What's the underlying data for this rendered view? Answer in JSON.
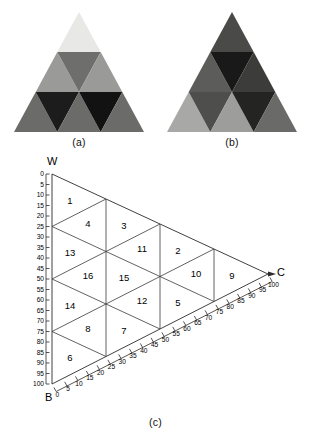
{
  "figure": {
    "panels": [
      {
        "id": "a",
        "caption": "(a)",
        "description": "subdivided-triangle-light-to-dark",
        "rows": 3,
        "cells": [
          {
            "index": 0,
            "row": 0,
            "pos": 0,
            "orientation": "up",
            "color": "#e8e8e6"
          },
          {
            "index": 1,
            "row": 1,
            "pos": 0,
            "orientation": "up",
            "color": "#9a9a98"
          },
          {
            "index": 2,
            "row": 1,
            "pos": 1,
            "orientation": "down",
            "color": "#6e6e6c"
          },
          {
            "index": 3,
            "row": 1,
            "pos": 2,
            "orientation": "up",
            "color": "#9a9a98"
          },
          {
            "index": 4,
            "row": 2,
            "pos": 0,
            "orientation": "up",
            "color": "#6b6b69"
          },
          {
            "index": 5,
            "row": 2,
            "pos": 1,
            "orientation": "down",
            "color": "#1c1c1c"
          },
          {
            "index": 6,
            "row": 2,
            "pos": 2,
            "orientation": "up",
            "color": "#6b6b69"
          },
          {
            "index": 7,
            "row": 2,
            "pos": 3,
            "orientation": "down",
            "color": "#121212"
          },
          {
            "index": 8,
            "row": 2,
            "pos": 4,
            "orientation": "up",
            "color": "#6b6b69"
          }
        ]
      },
      {
        "id": "b",
        "caption": "(b)",
        "description": "subdivided-triangle-dark-to-light",
        "rows": 3,
        "cells": [
          {
            "index": 0,
            "row": 0,
            "pos": 0,
            "orientation": "up",
            "color": "#4a4a48"
          },
          {
            "index": 1,
            "row": 1,
            "pos": 0,
            "orientation": "up",
            "color": "#5c5c5a"
          },
          {
            "index": 2,
            "row": 1,
            "pos": 1,
            "orientation": "down",
            "color": "#191919"
          },
          {
            "index": 3,
            "row": 1,
            "pos": 2,
            "orientation": "up",
            "color": "#3c3c3a"
          },
          {
            "index": 4,
            "row": 2,
            "pos": 0,
            "orientation": "up",
            "color": "#a8a8a6"
          },
          {
            "index": 5,
            "row": 2,
            "pos": 1,
            "orientation": "down",
            "color": "#4e4e4c"
          },
          {
            "index": 6,
            "row": 2,
            "pos": 2,
            "orientation": "up",
            "color": "#9d9d9b"
          },
          {
            "index": 7,
            "row": 2,
            "pos": 3,
            "orientation": "down",
            "color": "#242422"
          },
          {
            "index": 8,
            "row": 2,
            "pos": 4,
            "orientation": "up",
            "color": "#6a6a68"
          }
        ]
      },
      {
        "id": "c",
        "caption": "(c)",
        "description": "ternary-diagram-numbered-cells"
      }
    ]
  },
  "chart_data": {
    "type": "ternary",
    "title": "",
    "vertices": [
      {
        "label": "W",
        "position": "top-left",
        "value": 0
      },
      {
        "label": "B",
        "position": "bottom-left",
        "value": 100
      },
      {
        "label": "C",
        "position": "right",
        "value": 100
      }
    ],
    "axes": [
      {
        "name": "left-axis",
        "from_label": "W",
        "to_label": "B",
        "min": 0,
        "max": 100,
        "step": 5,
        "ticks": [
          0,
          5,
          10,
          15,
          20,
          25,
          30,
          35,
          40,
          45,
          50,
          55,
          60,
          65,
          70,
          75,
          80,
          85,
          90,
          95,
          100
        ]
      },
      {
        "name": "bottom-axis",
        "from_label": "B",
        "to_label": "C",
        "min": 0,
        "max": 100,
        "step": 5,
        "ticks": [
          0,
          5,
          10,
          15,
          20,
          25,
          30,
          35,
          40,
          45,
          50,
          55,
          60,
          65,
          70,
          75,
          80,
          85,
          90,
          95,
          100
        ]
      }
    ],
    "grid": true,
    "grid_step": 25,
    "cell_count": 16,
    "cells": [
      {
        "label": "1",
        "orientation": "up",
        "row": 0,
        "pos": 0
      },
      {
        "label": "3",
        "orientation": "down",
        "row": 1,
        "pos": 0
      },
      {
        "label": "4",
        "orientation": "up",
        "row": 1,
        "pos": 1
      },
      {
        "label": "2",
        "orientation": "up",
        "row": 1,
        "pos": 2
      },
      {
        "label": "11",
        "orientation": "down",
        "row": 2,
        "pos": 0
      },
      {
        "label": "13",
        "orientation": "up",
        "row": 2,
        "pos": 1
      },
      {
        "label": "9",
        "orientation": "up",
        "row": 2,
        "pos": 2
      },
      {
        "label": "10",
        "orientation": "down",
        "row": 2,
        "pos": 3
      },
      {
        "label": "15",
        "orientation": "up",
        "row": 3,
        "pos": 0
      },
      {
        "label": "16",
        "orientation": "down",
        "row": 3,
        "pos": 1
      },
      {
        "label": "5",
        "orientation": "up",
        "row": 3,
        "pos": 2
      },
      {
        "label": "12",
        "orientation": "down",
        "row": 3,
        "pos": 3
      },
      {
        "label": "14",
        "orientation": "up",
        "row": 3,
        "pos": 4
      },
      {
        "label": "7",
        "orientation": "up",
        "row": 4,
        "pos": 0
      },
      {
        "label": "8",
        "orientation": "down",
        "row": 4,
        "pos": 1
      },
      {
        "label": "6",
        "orientation": "up",
        "row": 4,
        "pos": 2
      }
    ],
    "cell_labels": [
      "1",
      "2",
      "3",
      "4",
      "5",
      "6",
      "7",
      "8",
      "9",
      "10",
      "11",
      "12",
      "13",
      "14",
      "15",
      "16"
    ]
  },
  "colors": {
    "line": "#2b2b2b",
    "text": "#000000",
    "background": "#ffffff"
  }
}
